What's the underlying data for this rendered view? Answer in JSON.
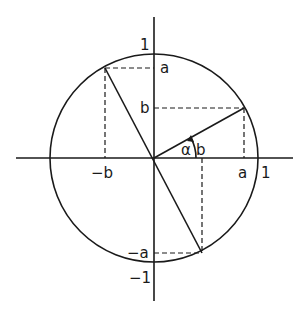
{
  "diagram": {
    "type": "unit-circle",
    "colors": {
      "ink": "#1a1a1a",
      "background": "#ffffff"
    },
    "labels": {
      "y_top": "1",
      "y_bottom": "−1",
      "x_right": "1",
      "a_on_y": "a",
      "b_on_y": "b",
      "neg_a_on_y": "−a",
      "a_on_x": "a",
      "neg_b_on_x": "−b",
      "b_on_x": "b",
      "angle": "α"
    },
    "points": [
      {
        "name": "P",
        "coords": "(a, b)"
      },
      {
        "name": "Q",
        "coords": "(-b, a)"
      },
      {
        "name": "R",
        "coords": "(b, -a)"
      }
    ]
  }
}
